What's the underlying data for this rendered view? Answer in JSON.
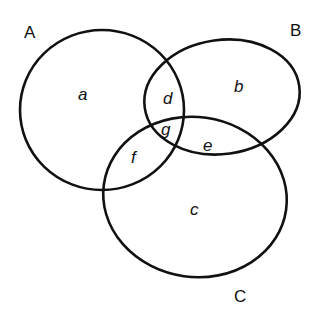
{
  "diagram": {
    "type": "venn",
    "stroke_color": "#111111",
    "background": "#ffffff",
    "sets": [
      {
        "id": "A",
        "label": "A"
      },
      {
        "id": "B",
        "label": "B"
      },
      {
        "id": "C",
        "label": "C"
      }
    ],
    "regions": [
      {
        "id": "a",
        "label": "a",
        "membership": [
          "A"
        ]
      },
      {
        "id": "b",
        "label": "b",
        "membership": [
          "B"
        ]
      },
      {
        "id": "c",
        "label": "c",
        "membership": [
          "C"
        ]
      },
      {
        "id": "d",
        "label": "d",
        "membership": [
          "A",
          "B"
        ]
      },
      {
        "id": "e",
        "label": "e",
        "membership": [
          "B",
          "C"
        ]
      },
      {
        "id": "f",
        "label": "f",
        "membership": [
          "A",
          "C"
        ]
      },
      {
        "id": "g",
        "label": "g",
        "membership": [
          "A",
          "B",
          "C"
        ]
      }
    ]
  },
  "labels": {
    "set_a": "A",
    "set_b": "B",
    "set_c": "C",
    "region_a": "a",
    "region_b": "b",
    "region_c": "c",
    "region_d": "d",
    "region_e": "e",
    "region_f": "f",
    "region_g": "g"
  }
}
